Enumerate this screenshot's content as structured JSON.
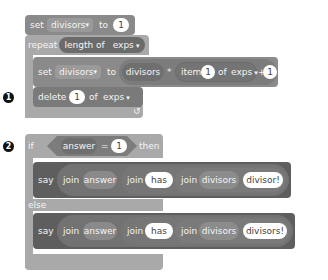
{
  "script": {
    "set_block_1": {
      "keyword": "set",
      "variable": "divisors",
      "to_label": "to",
      "value": "1"
    },
    "repeat_block": {
      "keyword": "repeat",
      "length_of_label": "length of",
      "list": "exps",
      "loop_arrow": "↺"
    },
    "set_block_2": {
      "keyword": "set",
      "variable": "divisors",
      "to_label": "to",
      "var_reporter": "divisors",
      "times_op": "*",
      "item_label": "item",
      "item_index": "1",
      "of_label": "of",
      "list": "exps",
      "plus_op": "+",
      "plus_value": "1"
    },
    "delete_block": {
      "keyword": "delete",
      "index": "1",
      "of_label": "of",
      "list": "exps"
    },
    "if_block": {
      "keyword": "if",
      "answer_reporter": "answer",
      "equals_op": "=",
      "compare_value": "1",
      "then_label": "then",
      "else_label": "else"
    },
    "say_block_1": {
      "keyword": "say",
      "join1": "join",
      "answer": "answer",
      "join2": "join",
      "has": "has",
      "join3": "join",
      "divisors": "divisors",
      "suffix": "divisor!"
    },
    "say_block_2": {
      "keyword": "say",
      "join1": "join",
      "answer": "answer",
      "join2": "join",
      "has": "has",
      "join3": "join",
      "divisors": "divisors",
      "suffix": "divisors!"
    }
  },
  "annotations": {
    "badge_1": "1",
    "badge_2": "2"
  }
}
